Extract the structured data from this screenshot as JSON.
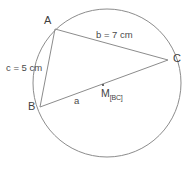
{
  "figure": {
    "type": "circle-inscribed-triangle",
    "background_color": "#ffffff",
    "stroke_color": "#8c8c8c",
    "text_color": "#4a4a4a",
    "circle": {
      "cx": 107,
      "cy": 83,
      "r": 74
    },
    "vertices": {
      "A": {
        "x": 55,
        "y": 29,
        "label": "A"
      },
      "B": {
        "x": 40,
        "y": 107,
        "label": "B"
      },
      "C": {
        "x": 168,
        "y": 60,
        "label": "C"
      }
    },
    "midpoint": {
      "label": "M",
      "subscript": "[BC]",
      "x": 103,
      "y": 85,
      "dot_radius": 1.1
    },
    "sides": {
      "a": {
        "label": "a",
        "from": "B",
        "to": "C"
      },
      "b": {
        "label": "b = 7 cm",
        "from": "A",
        "to": "C"
      },
      "c": {
        "label": "c = 5 cm",
        "from": "A",
        "to": "B"
      }
    }
  }
}
